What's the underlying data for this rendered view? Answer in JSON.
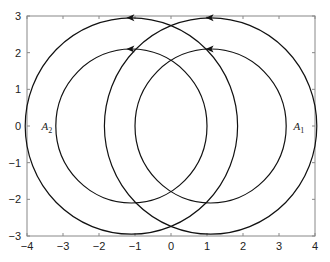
{
  "chart_data": {
    "type": "line",
    "title": "",
    "xlabel": "",
    "ylabel": "",
    "xlim": [
      -4,
      4
    ],
    "ylim": [
      -3,
      3
    ],
    "grid": false,
    "xticks": [
      -4,
      -3,
      -2,
      -1,
      0,
      1,
      2,
      3,
      4
    ],
    "yticks": [
      -3,
      -2,
      -1,
      0,
      1,
      2,
      3
    ],
    "xtick_labels": [
      "−4",
      "−3",
      "−2",
      "−1",
      "0",
      "1",
      "2",
      "3",
      "4"
    ],
    "ytick_labels": [
      "−3",
      "−2",
      "−1",
      "0",
      "1",
      "2",
      "3"
    ],
    "series": [
      {
        "name": "left outer circle",
        "shape": "circle",
        "center": [
          -1.1,
          0
        ],
        "radius": 2.95,
        "direction": "counterclockwise",
        "arrow_at": [
          -1.1,
          2.95
        ]
      },
      {
        "name": "left inner circle",
        "shape": "circle",
        "center": [
          -1.1,
          0
        ],
        "radius": 2.1,
        "direction": "counterclockwise",
        "arrow_at": [
          -1.1,
          2.1
        ]
      },
      {
        "name": "right outer circle",
        "shape": "circle",
        "center": [
          1.1,
          0
        ],
        "radius": 2.95,
        "direction": "counterclockwise",
        "arrow_at": [
          1.1,
          2.95
        ]
      },
      {
        "name": "right inner circle",
        "shape": "circle",
        "center": [
          1.1,
          0
        ],
        "radius": 2.1,
        "direction": "counterclockwise",
        "arrow_at": [
          1.1,
          2.1
        ]
      }
    ],
    "annotations": [
      {
        "text": "A",
        "sub": "2",
        "x": -3.6,
        "y": 0
      },
      {
        "text": "A",
        "sub": "1",
        "x": 3.4,
        "y": 0
      }
    ],
    "line_color": "#111111",
    "axis_color": "#888888"
  }
}
